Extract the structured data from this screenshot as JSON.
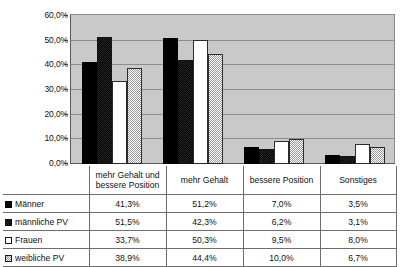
{
  "chart_data": {
    "type": "bar",
    "title": "",
    "xlabel": "",
    "ylabel": "",
    "ylim": [
      0,
      60
    ],
    "grid": true,
    "legend_position": "table-below",
    "categories": [
      "mehr Gehalt und bessere Position",
      "mehr Gehalt",
      "bessere Position",
      "Sonstiges"
    ],
    "ytick_labels": [
      "60,0%",
      "50,0%",
      "40,0%",
      "30,0%",
      "20,0%",
      "10,0%",
      "0,0%"
    ],
    "ytick_values": [
      60,
      50,
      40,
      30,
      20,
      10,
      0
    ],
    "series": [
      {
        "name": "Männer",
        "marker": "filled-black-square",
        "values": [
          41.3,
          51.2,
          7.0,
          3.5
        ],
        "labels": [
          "41,3%",
          "51,2%",
          "7,0%",
          "3,5%"
        ]
      },
      {
        "name": "männliche PV",
        "marker": "dark-checkered-square",
        "values": [
          51.5,
          42.3,
          6.2,
          3.1
        ],
        "labels": [
          "51,5%",
          "42,3%",
          "6,2%",
          "3,1%"
        ]
      },
      {
        "name": "Frauen",
        "marker": "white-outlined-square",
        "values": [
          33.7,
          50.3,
          9.5,
          8.0
        ],
        "labels": [
          "33,7%",
          "50,3%",
          "9,5%",
          "8,0%"
        ]
      },
      {
        "name": "weibliche PV",
        "marker": "light-checkered-square",
        "values": [
          38.9,
          44.4,
          10.0,
          6.7
        ],
        "labels": [
          "38,9%",
          "44,4%",
          "10,0%",
          "6,7%"
        ]
      }
    ]
  },
  "colors": {
    "plot_background": "#c9c9c9",
    "gridline": "#8d8d8d",
    "axis": "#5a5a5a",
    "series_1": "#000000",
    "series_2": "#2a2a2a",
    "series_3": "#ffffff",
    "series_4": "#ffffff",
    "table_border": "#6e6e6e",
    "text": "#111111"
  }
}
